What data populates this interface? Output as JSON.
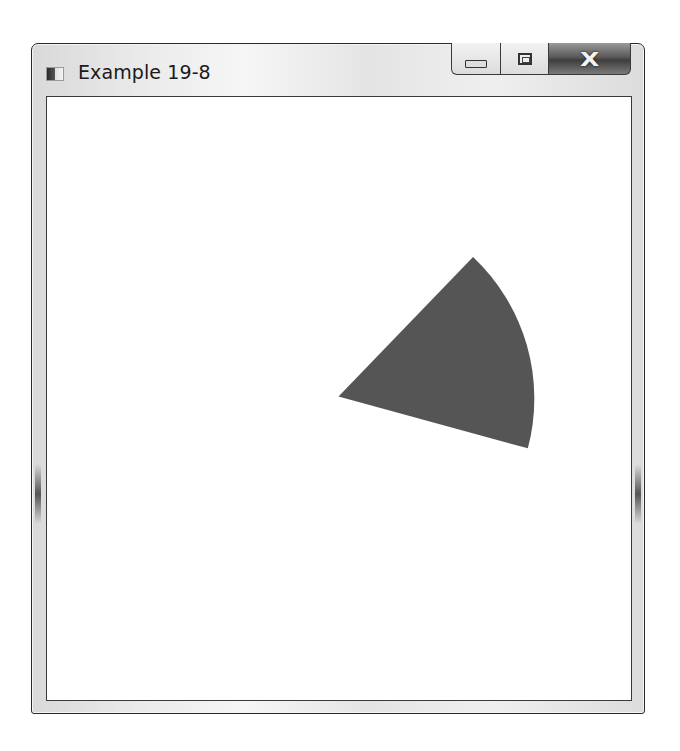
{
  "window": {
    "title": "Example 19-8",
    "icon": "app-window-icon",
    "controls": {
      "minimize": {
        "icon": "minimize-icon",
        "glyph": ""
      },
      "maximize": {
        "icon": "maximize-icon",
        "glyph": ""
      },
      "close": {
        "icon": "close-icon",
        "glyph": "X"
      }
    }
  },
  "content": {
    "shape": {
      "type": "pie-wedge",
      "fill": "#555555",
      "center": [
        338,
        396
      ],
      "radius": 195,
      "start_point": [
        473,
        256
      ],
      "end_point": [
        528,
        448
      ]
    }
  },
  "colors": {
    "background": "#ffffff",
    "frame": "#e6e6e6",
    "border": "#2a2a2a",
    "wedge": "#555555"
  }
}
